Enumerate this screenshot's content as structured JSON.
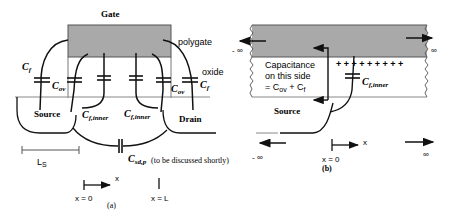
{
  "figure_a": {
    "gate_label": "Gate",
    "polygate_label": "polygate",
    "oxide_label": "oxide",
    "cf_left": "C",
    "cf_left_sub": "f",
    "cov_left": "C",
    "cov_left_sub": "ov",
    "cov_right": "C",
    "cov_right_sub": "ov",
    "cf_right": "C",
    "cf_right_sub": "f",
    "source_label": "Source",
    "drain_label": "Drain",
    "cf_inner_left": "C",
    "cf_inner_left_sub": "f,inner",
    "cf_inner_right": "C",
    "cf_inner_right_sub": "f,inner",
    "ls_label": "L",
    "ls_sub": "S",
    "csd_label": "C",
    "csd_sub": "sd,p",
    "csd_note": "(to be discussed shortly)",
    "x_axis_label": "x",
    "x0_label": "x = 0",
    "xL_label": "x = L",
    "caption": "(a)"
  },
  "figure_b": {
    "neg_inf_top": "- ∞",
    "pos_inf_top": "∞",
    "capacitance_line1": "Capacitance",
    "capacitance_line2": "on this side",
    "capacitance_line3_prefix": "= C",
    "capacitance_line3_sub1": "ov",
    "capacitance_line3_mid": " + C",
    "capacitance_line3_sub2": "f",
    "plus_charges": "+ + + + + + + + +",
    "cf_inner": "C",
    "cf_inner_sub": "f,inner",
    "source_label": "Source",
    "neg_inf_bottom": "- ∞",
    "pos_inf_bottom": "∞",
    "x_axis_label": "x",
    "x0_label": "x = 0",
    "caption": "(b)"
  },
  "colors": {
    "gate_fill": "#a9a9a9",
    "line": "#111111",
    "oxide_line": "#888888"
  }
}
